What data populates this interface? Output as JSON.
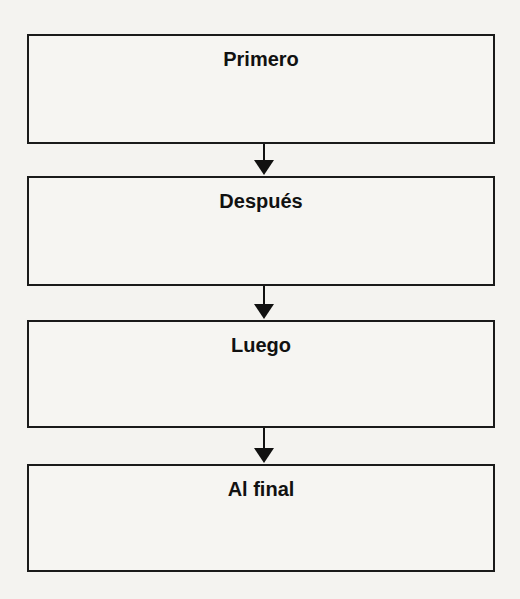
{
  "diagram": {
    "type": "sequence-flowchart",
    "steps": [
      {
        "label": "Primero"
      },
      {
        "label": "Después"
      },
      {
        "label": "Luego"
      },
      {
        "label": "Al final"
      }
    ],
    "colors": {
      "border": "#1a1a1a",
      "background": "#f4f3f0",
      "text": "#111111"
    }
  }
}
